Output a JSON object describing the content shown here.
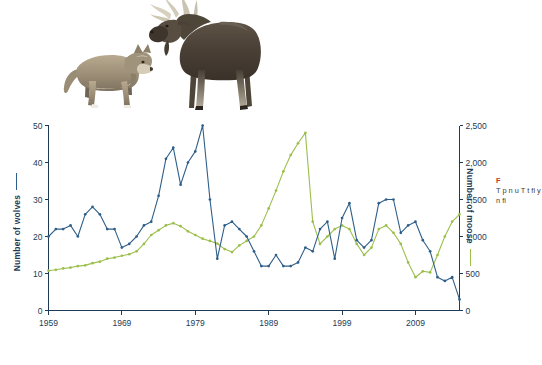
{
  "figure": {
    "illustrations": [
      {
        "name": "wolf",
        "label": "Grey wolf"
      },
      {
        "name": "moose",
        "label": "Bull moose"
      }
    ]
  },
  "side_caption": {
    "heading": "F",
    "body": "T p n u T t fi y n fi"
  },
  "axes": {
    "left_title": "Number of wolves",
    "right_title": "Number of moose",
    "left_ticks": [
      "0",
      "10",
      "20",
      "30",
      "40",
      "50"
    ],
    "right_ticks": [
      "0",
      "500",
      "1,000",
      "1,500",
      "2,000",
      "2,500"
    ],
    "x_ticks": [
      "1959",
      "1969",
      "1979",
      "1989",
      "1999",
      "2009"
    ]
  },
  "colors": {
    "wolves": "#2e5f8a",
    "moose": "#9cbf4c",
    "axis": "#1d3b57",
    "caption_heading": "#c0392b",
    "background": "#ffffff"
  },
  "chart_data": {
    "type": "line",
    "title": "",
    "subtitle": "",
    "xlabel": "",
    "ylabel": "Number of wolves",
    "y2label": "Number of moose",
    "grid": false,
    "legend_position": "axis-labels",
    "xlim": [
      1959,
      2015
    ],
    "ylim": [
      0,
      50
    ],
    "y2lim": [
      0,
      2500
    ],
    "x": [
      1959,
      1960,
      1961,
      1962,
      1963,
      1964,
      1965,
      1966,
      1967,
      1968,
      1969,
      1970,
      1971,
      1972,
      1973,
      1974,
      1975,
      1976,
      1977,
      1978,
      1979,
      1980,
      1981,
      1982,
      1983,
      1984,
      1985,
      1986,
      1987,
      1988,
      1989,
      1990,
      1991,
      1992,
      1993,
      1994,
      1995,
      1996,
      1997,
      1998,
      1999,
      2000,
      2001,
      2002,
      2003,
      2004,
      2005,
      2006,
      2007,
      2008,
      2009,
      2010,
      2011,
      2012,
      2013,
      2014,
      2015
    ],
    "series": [
      {
        "name": "Number of wolves",
        "axis": "left",
        "color": "#2e5f8a",
        "values": [
          20,
          22,
          22,
          23,
          20,
          26,
          28,
          26,
          22,
          22,
          17,
          18,
          20,
          23,
          24,
          31,
          41,
          44,
          34,
          40,
          43,
          50,
          30,
          14,
          23,
          24,
          22,
          20,
          16,
          12,
          12,
          15,
          12,
          12,
          13,
          17,
          16,
          22,
          24,
          14,
          25,
          29,
          19,
          17,
          19,
          29,
          30,
          30,
          21,
          23,
          24,
          19,
          16,
          9,
          8,
          9,
          3
        ]
      },
      {
        "name": "Number of moose",
        "axis": "right",
        "color": "#9cbf4c",
        "values": [
          538,
          550,
          568,
          580,
          600,
          610,
          640,
          660,
          700,
          715,
          740,
          760,
          800,
          900,
          1020,
          1085,
          1150,
          1180,
          1140,
          1070,
          1020,
          970,
          940,
          905,
          830,
          790,
          880,
          940,
          1000,
          1150,
          1380,
          1620,
          1880,
          2100,
          2260,
          2400,
          1200,
          900,
          1000,
          1100,
          1150,
          1100,
          900,
          750,
          850,
          1100,
          1150,
          1050,
          900,
          650,
          450,
          530,
          515,
          750,
          1000,
          1200,
          1300
        ]
      }
    ]
  }
}
